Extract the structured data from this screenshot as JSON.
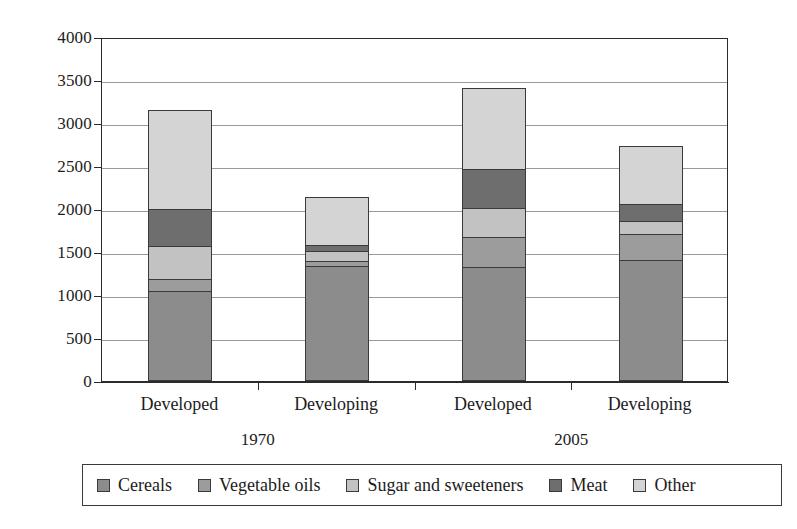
{
  "chart_data": {
    "type": "bar",
    "subtype": "stacked-bar",
    "title": "",
    "xlabel": "",
    "ylabel": "",
    "ylim": [
      0,
      4000
    ],
    "ytick_step": 500,
    "yticks": [
      "4000",
      "3500",
      "3000",
      "2500",
      "2000",
      "1500",
      "1000",
      "500",
      "0"
    ],
    "grid": true,
    "grid_axis": "y",
    "legend_position": "bottom",
    "categories": [
      "Developed",
      "Developing",
      "Developed",
      "Developing"
    ],
    "groups": [
      {
        "label": "1970",
        "categories": [
          "Developed",
          "Developing"
        ]
      },
      {
        "label": "2005",
        "categories": [
          "Developed",
          "Developing"
        ]
      }
    ],
    "series": [
      {
        "name": "Cereals",
        "color": "#8c8c8c",
        "values": [
          1050,
          1335,
          1330,
          1410
        ]
      },
      {
        "name": "Vegetable oils",
        "color": "#9c9c9c",
        "values": [
          140,
          65,
          340,
          300
        ]
      },
      {
        "name": "Sugar and sweeteners",
        "color": "#c2c2c2",
        "values": [
          380,
          110,
          340,
          145
        ]
      },
      {
        "name": "Meat",
        "color": "#6e6e6e",
        "values": [
          430,
          75,
          450,
          200
        ]
      },
      {
        "name": "Other",
        "color": "#d4d4d4",
        "values": [
          1150,
          550,
          950,
          675
        ]
      }
    ],
    "totals": [
      3150,
      2135,
      3410,
      2730
    ]
  },
  "legend": {
    "items": [
      {
        "label": "Cereals",
        "swatch": "#8c8c8c"
      },
      {
        "label": "Vegetable oils",
        "swatch": "#9c9c9c"
      },
      {
        "label": "Sugar and sweeteners",
        "swatch": "#c2c2c2"
      },
      {
        "label": "Meat",
        "swatch": "#6e6e6e"
      },
      {
        "label": "Other",
        "swatch": "#d4d4d4"
      }
    ]
  },
  "axis": {
    "y_labels": [
      "4000",
      "3500",
      "3000",
      "2500",
      "2000",
      "1500",
      "1000",
      "500",
      "0"
    ],
    "x_labels": [
      "Developed",
      "Developing",
      "Developed",
      "Developing"
    ],
    "group_labels": [
      "1970",
      "2005"
    ]
  },
  "colors": {
    "axis": "#2b2b2b",
    "grid": "#9a9a9a",
    "background": "#ffffff",
    "text": "#1c1c1c"
  }
}
